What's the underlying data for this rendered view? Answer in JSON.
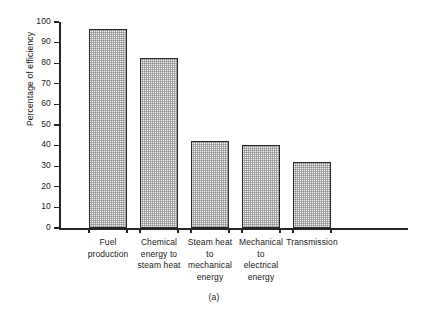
{
  "chart_data": {
    "type": "bar",
    "title": "",
    "subtitle": "",
    "xlabel": "",
    "ylabel": "Percentage of efficiency",
    "ylim": [
      0,
      100
    ],
    "yticks": [
      0,
      10,
      20,
      30,
      40,
      50,
      60,
      70,
      80,
      90,
      100
    ],
    "ytick_labels": [
      "0",
      "10",
      "20",
      "30",
      "40",
      "50",
      "60",
      "70",
      "80",
      "90",
      "100"
    ],
    "grid": false,
    "legend": null,
    "legend_position": "none",
    "categories": [
      "Fuel production",
      "Chemical energy to steam heat",
      "Steam heat to mechanical energy",
      "Mechanical to electrical energy",
      "Transmission"
    ],
    "category_label_lines": [
      [
        "Fuel",
        "production"
      ],
      [
        "Chemical",
        "energy to",
        "steam heat"
      ],
      [
        "Steam heat",
        "to",
        "mechanical",
        "energy"
      ],
      [
        "Mechanical",
        "to",
        "electrical",
        "energy"
      ],
      [
        "Transmission"
      ]
    ],
    "values": [
      96.5,
      82.5,
      42,
      40.5,
      32
    ],
    "bar_fill": "#f2f2f2",
    "bar_edge": "#2b2b2b",
    "bar_pattern": "fine-stipple-checker",
    "axis_color": "#262626"
  },
  "figure": {
    "caption": "(a)"
  }
}
